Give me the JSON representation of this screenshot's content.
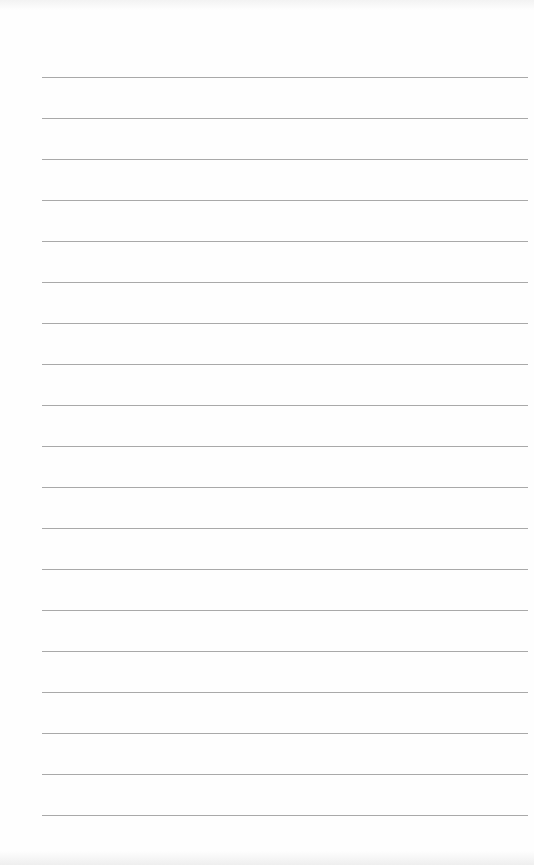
{
  "page": {
    "type": "lined-paper",
    "background_color": "#fefefe",
    "line_color": "#9a9a9a",
    "line_count": 19,
    "first_line_y": 77,
    "line_spacing": 41,
    "line_left": 42,
    "line_right": 528
  }
}
